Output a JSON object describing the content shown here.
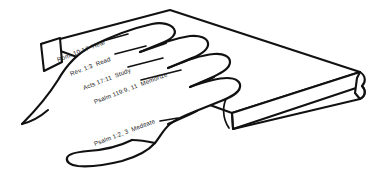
{
  "illustration": {
    "title": "The Word Hand",
    "subject": "hand-gripping-book",
    "background_color": "#ffffff",
    "ink_color": "#111111",
    "width": 381,
    "height": 178
  },
  "book": {
    "name": "bible-book",
    "cover_color": "#ffffff",
    "edge_color": "#111111",
    "parts": {
      "top_cover": "top-cover-face",
      "front_edge": "front-page-edge",
      "spine_corner": "far-spine-corner",
      "page_block": "page-block-face"
    }
  },
  "hand": {
    "name": "hand-outline",
    "fill_color": "#ffffff",
    "digits": [
      {
        "id": "index-finger",
        "label_index": 0
      },
      {
        "id": "middle-finger",
        "label_index": 1
      },
      {
        "id": "ring-finger",
        "label_index": 2
      },
      {
        "id": "little-finger",
        "label_index": 3
      },
      {
        "id": "thumb",
        "label_index": 4
      }
    ]
  },
  "labels": [
    {
      "id": "hear",
      "reference": "Rom. 10:17",
      "method": "Hear",
      "full": "Rom. 10:17  Hear",
      "finger": "index-finger"
    },
    {
      "id": "read",
      "reference": "Rev. 1:3",
      "method": "Read",
      "full": "Rev. 1:3  Read",
      "finger": "middle-finger"
    },
    {
      "id": "study",
      "reference": "Acts 17:11",
      "method": "Study",
      "full": "Acts 17:11  Study",
      "finger": "ring-finger"
    },
    {
      "id": "memorize",
      "reference": "Psalm 119:9, 11",
      "method": "Memorize",
      "full": "Psalm 119:9, 11  Memorize",
      "finger": "little-finger"
    },
    {
      "id": "meditate",
      "reference": "Psalm 1:2, 3",
      "method": "Meditate",
      "full": "Psalm 1:2, 3  Meditate",
      "finger": "thumb"
    }
  ]
}
